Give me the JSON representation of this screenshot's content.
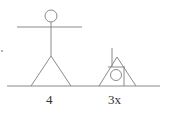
{
  "figure": {
    "labels": {
      "left_figure": "4",
      "right_figure": "3x"
    },
    "colors": {
      "stroke": "#8a8a8a",
      "text": "#333333"
    },
    "elements": [
      {
        "name": "standing-stick-figure",
        "label": "4"
      },
      {
        "name": "triangle-with-circle-figure",
        "label": "3x"
      }
    ]
  }
}
